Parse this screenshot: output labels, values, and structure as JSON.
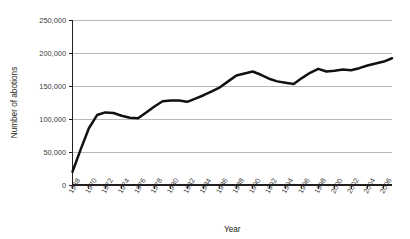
{
  "chart_data": {
    "type": "line",
    "title": "",
    "xlabel": "Year",
    "ylabel": "Number of abotions",
    "xlim": [
      1968,
      2007
    ],
    "ylim": [
      0,
      250000
    ],
    "grid": true,
    "legend": false,
    "y_ticks": [
      0,
      50000,
      100000,
      150000,
      200000,
      250000
    ],
    "y_tick_labels": [
      "0",
      "50,000",
      "100,000",
      "150,000",
      "200,000",
      "250,000"
    ],
    "x_tick_labels": [
      "1968",
      "1970",
      "1972",
      "1974",
      "1976",
      "1978",
      "1980",
      "1982",
      "1984",
      "1986",
      "1988",
      "1990",
      "1992",
      "1994",
      "1996",
      "1998",
      "2000",
      "2002",
      "2004",
      "2006"
    ],
    "x": [
      1968,
      1969,
      1970,
      1971,
      1972,
      1973,
      1974,
      1975,
      1976,
      1977,
      1978,
      1979,
      1980,
      1981,
      1982,
      1983,
      1984,
      1985,
      1986,
      1987,
      1988,
      1989,
      1990,
      1991,
      1992,
      1993,
      1994,
      1995,
      1996,
      1997,
      1998,
      1999,
      2000,
      2001,
      2002,
      2003,
      2004,
      2005,
      2006,
      2007
    ],
    "values": [
      20000,
      54000,
      86000,
      106000,
      110000,
      109000,
      105000,
      102000,
      101000,
      110000,
      119000,
      127000,
      128000,
      128000,
      126000,
      131000,
      136000,
      142000,
      148000,
      157000,
      166000,
      169000,
      172000,
      167000,
      161000,
      157000,
      155000,
      153000,
      162000,
      170000,
      176000,
      172000,
      173000,
      175000,
      174000,
      177000,
      181000,
      184000,
      187000,
      192000
    ],
    "series_name": "Number of abotions",
    "line_color": "#111111"
  }
}
